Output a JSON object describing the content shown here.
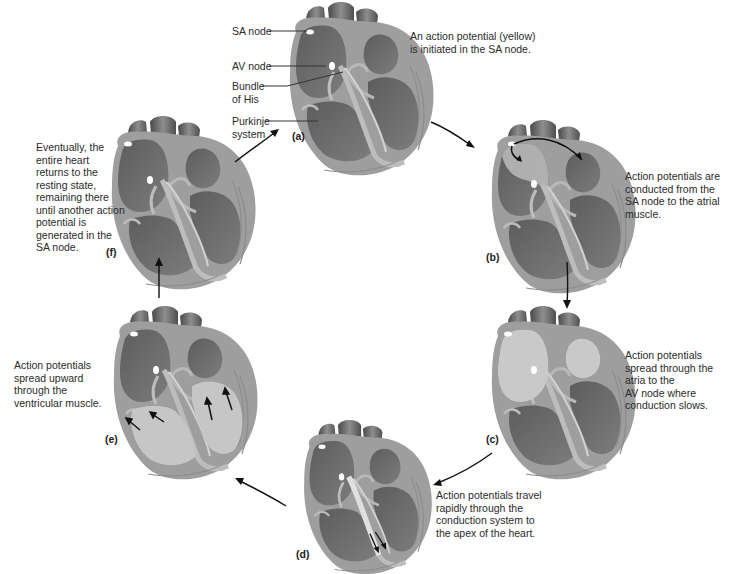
{
  "figure": {
    "callouts": {
      "sa_node": "SA node",
      "av_node": "AV node",
      "bundle_of_his": "Bundle\nof His",
      "purkinje_system": "Purkinje\nsystem"
    },
    "panels": [
      {
        "id": "a",
        "label": "(a)",
        "caption": "An action potential (yellow)\nis initiated in the SA node."
      },
      {
        "id": "b",
        "label": "(b)",
        "caption": "Action potentials are\nconducted from the\nSA node to the atrial\nmuscle."
      },
      {
        "id": "c",
        "label": "(c)",
        "caption": "Action potentials\nspread through the\natria to the\nAV node where\nconduction slows."
      },
      {
        "id": "d",
        "label": "(d)",
        "caption": "Action potentials travel\nrapidly through the\nconduction system to\nthe apex of the heart."
      },
      {
        "id": "e",
        "label": "(e)",
        "caption": "Action potentials\nspread upward\nthrough the\nventricular muscle."
      },
      {
        "id": "f",
        "label": "(f)",
        "caption": "Eventually, the\nentire heart\nreturns to the\nresting state,\nremaining there\nuntil another action\npotential is\ngenerated in the\nSA node."
      }
    ],
    "colors": {
      "background": "#ffffff",
      "heart_dark": "#6e6e6e",
      "heart_mid": "#8a8a8a",
      "heart_wall": "#a9a9a9",
      "active_region": "#c4c4c4",
      "node": "#ffffff",
      "arrow": "#1a1a1a"
    }
  }
}
